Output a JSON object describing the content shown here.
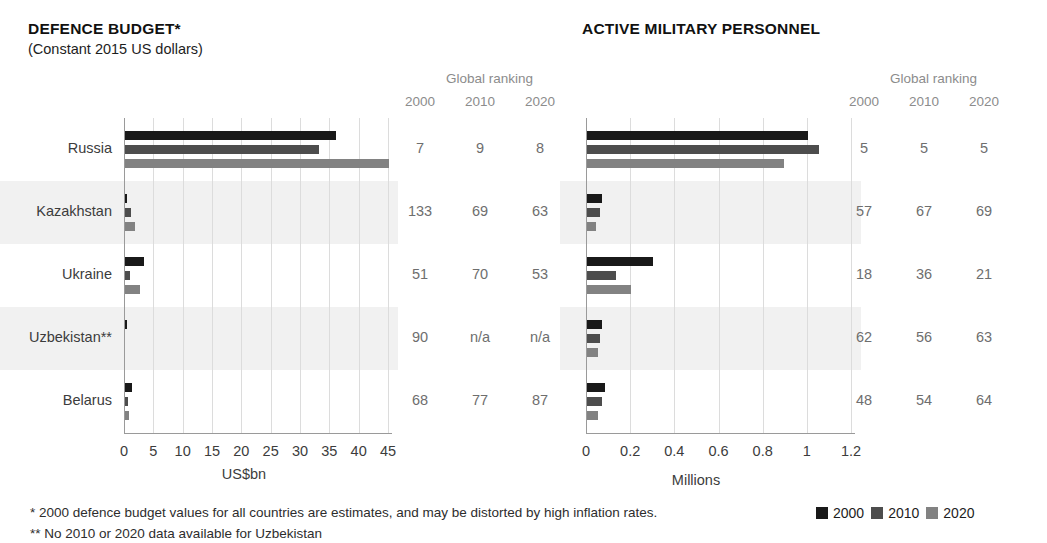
{
  "left": {
    "title": "DEFENCE BUDGET*",
    "subtitle": "(Constant 2015 US dollars)",
    "ranking_header": "Global ranking",
    "ranking_years": [
      "2000",
      "2010",
      "2020"
    ],
    "axis_caption": "US$bn",
    "ticks": [
      "0",
      "5",
      "10",
      "15",
      "20",
      "25",
      "30",
      "35",
      "40",
      "45"
    ],
    "rankings": [
      [
        "7",
        "9",
        "8"
      ],
      [
        "133",
        "69",
        "63"
      ],
      [
        "51",
        "70",
        "53"
      ],
      [
        "90",
        "n/a",
        "n/a"
      ],
      [
        "68",
        "77",
        "87"
      ]
    ]
  },
  "right": {
    "title": "ACTIVE MILITARY PERSONNEL",
    "ranking_header": "Global ranking",
    "ranking_years": [
      "2000",
      "2010",
      "2020"
    ],
    "axis_caption": "Millions",
    "ticks": [
      "0",
      "0.2",
      "0.4",
      "0.6",
      "0.8",
      "1",
      "1.2"
    ],
    "rankings": [
      [
        "5",
        "5",
        "5"
      ],
      [
        "57",
        "67",
        "69"
      ],
      [
        "18",
        "36",
        "21"
      ],
      [
        "62",
        "56",
        "63"
      ],
      [
        "48",
        "54",
        "64"
      ]
    ]
  },
  "categories": [
    "Russia",
    "Kazakhstan",
    "Ukraine",
    "Uzbekistan**",
    "Belarus"
  ],
  "footnotes": [
    "* 2000 defence budget values for all countries are estimates, and may be distorted by high inflation rates.",
    "** No 2010 or 2020 data available for Uzbekistan"
  ],
  "legend": [
    {
      "label": "2000",
      "color": "#191919"
    },
    {
      "label": "2010",
      "color": "#4d4d4d"
    },
    {
      "label": "2020",
      "color": "#828282"
    }
  ],
  "colors": {
    "series_2000": "#191919",
    "series_2010": "#4d4d4d",
    "series_2020": "#828282",
    "band": "#f1f1f1",
    "grid": "#dcdcdc",
    "axis": "#9a9a9a"
  },
  "chart_data": [
    {
      "type": "bar",
      "title": "DEFENCE BUDGET*",
      "subtitle": "(Constant 2015 US dollars)",
      "orientation": "horizontal",
      "xlabel": "US$bn",
      "ylabel": "",
      "xlim": [
        0,
        45
      ],
      "xticks": [
        0,
        5,
        10,
        15,
        20,
        25,
        30,
        35,
        40,
        45
      ],
      "grid": true,
      "legend_position": "bottom-right",
      "categories": [
        "Russia",
        "Kazakhstan",
        "Ukraine",
        "Uzbekistan**",
        "Belarus"
      ],
      "series": [
        {
          "name": "2000",
          "values": [
            36.0,
            0.3,
            3.2,
            0.2,
            1.2
          ]
        },
        {
          "name": "2010",
          "values": [
            33.0,
            1.0,
            0.8,
            null,
            0.5
          ]
        },
        {
          "name": "2020",
          "values": [
            45.0,
            1.7,
            2.5,
            null,
            0.7
          ]
        }
      ],
      "global_ranking": {
        "years": [
          "2000",
          "2010",
          "2020"
        ],
        "rows": [
          {
            "category": "Russia",
            "values": [
              "7",
              "9",
              "8"
            ]
          },
          {
            "category": "Kazakhstan",
            "values": [
              "133",
              "69",
              "63"
            ]
          },
          {
            "category": "Ukraine",
            "values": [
              "51",
              "70",
              "53"
            ]
          },
          {
            "category": "Uzbekistan**",
            "values": [
              "90",
              "n/a",
              "n/a"
            ]
          },
          {
            "category": "Belarus",
            "values": [
              "68",
              "77",
              "87"
            ]
          }
        ]
      }
    },
    {
      "type": "bar",
      "title": "ACTIVE MILITARY PERSONNEL",
      "orientation": "horizontal",
      "xlabel": "Millions",
      "ylabel": "",
      "xlim": [
        0,
        1.2
      ],
      "xticks": [
        0,
        0.2,
        0.4,
        0.6,
        0.8,
        1,
        1.2
      ],
      "grid": true,
      "legend_position": "bottom-right",
      "categories": [
        "Russia",
        "Kazakhstan",
        "Ukraine",
        "Uzbekistan**",
        "Belarus"
      ],
      "series": [
        {
          "name": "2000",
          "values": [
            1.0,
            0.07,
            0.3,
            0.07,
            0.08
          ]
        },
        {
          "name": "2010",
          "values": [
            1.05,
            0.06,
            0.13,
            0.06,
            0.07
          ]
        },
        {
          "name": "2020",
          "values": [
            0.89,
            0.04,
            0.2,
            0.05,
            0.05
          ]
        }
      ],
      "global_ranking": {
        "years": [
          "2000",
          "2010",
          "2020"
        ],
        "rows": [
          {
            "category": "Russia",
            "values": [
              "5",
              "5",
              "5"
            ]
          },
          {
            "category": "Kazakhstan",
            "values": [
              "57",
              "67",
              "69"
            ]
          },
          {
            "category": "Ukraine",
            "values": [
              "18",
              "36",
              "21"
            ]
          },
          {
            "category": "Uzbekistan**",
            "values": [
              "62",
              "56",
              "63"
            ]
          },
          {
            "category": "Belarus",
            "values": [
              "48",
              "54",
              "64"
            ]
          }
        ]
      }
    }
  ]
}
